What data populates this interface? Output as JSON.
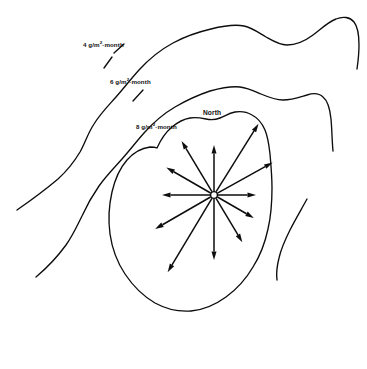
{
  "figure": {
    "type": "contour-map",
    "background_color": "#ffffff",
    "line_color": "#0d0d0d",
    "width": 367,
    "height": 369
  },
  "labels": {
    "contour_4": {
      "value": "4",
      "unit_prefix": " g/m",
      "exponent": "2",
      "unit_suffix": "·month"
    },
    "contour_6": {
      "value": "6",
      "unit_prefix": " g/m",
      "exponent": "2",
      "unit_suffix": "·month"
    },
    "contour_8": {
      "value": "8",
      "unit_prefix": " g/m",
      "exponent": "2",
      "unit_suffix": "·month"
    },
    "north": "North"
  },
  "contours": [
    {
      "name": "contour-4",
      "label": "4 g/m2·month",
      "level": 4,
      "closed": false,
      "path": "M 17 210 C 30 201 45 190 58 179 C 68 170 74 162 80 152 C 85 143 88 133 94 124 C 100 114 108 106 116 97 C 124 88 130 80 139 70 C 149 59 160 50 173 43 C 186 36 198 32 211 29 C 223 26 234 24 244 26 C 253 28 259 33 266 37 C 273 41 279 45 287 45 C 296 45 305 41 313 35 C 321 29 328 22 336 19 C 343 16 350 17 354 22 C 358 27 359 35 359 45 C 359 54 358 62 357 69"
    },
    {
      "name": "contour-6",
      "label": "6 g/m2·month",
      "level": 6,
      "closed": false,
      "path": "M 36 277 C 48 267 58 256 66 245 C 73 235 77 226 82 216 C 87 205 92 196 99 186 C 106 176 114 168 122 159 C 130 150 136 142 144 133 C 153 123 163 114 175 107 C 187 100 198 95 210 91 C 221 88 231 86 240 87 C 248 88 254 91 261 94 C 268 97 275 100 283 100 C 292 100 300 97 307 95 C 313 93 319 93 323 97 C 328 101 330 109 331 119 C 332 130 332 141 333 151"
    },
    {
      "name": "contour-8",
      "label": "8 g/m2·month",
      "level": 8,
      "closed": true,
      "path": "M 157 148 C 161 139 166 132 172 127 C 178 122 184 119 190 118 C 196 117 201 118 206 119 C 211 120 215 120 220 118 C 225 116 229 113 235 112 C 241 111 247 112 252 115 C 258 118 262 123 265 130 C 268 137 269 145 270 154 C 271 165 272 176 272 188 C 272 202 271 216 268 229 C 265 243 260 256 253 267 C 246 279 237 289 226 297 C 215 305 203 310 191 311 C 178 312 166 309 155 303 C 143 296 133 286 125 274 C 117 262 112 248 110 234 C 108 219 109 205 112 192 C 115 179 120 168 127 160 C 134 152 142 148 150 147 C 153 147 155 147 157 148 Z"
    },
    {
      "name": "right-edge-line",
      "label": "",
      "level": null,
      "closed": false,
      "path": "M 307 199 C 301 210 295 220 290 230 C 285 240 281 249 279 258 C 277 266 276 273 277 280"
    }
  ],
  "source_point": {
    "name": "source-hub",
    "cx": 214,
    "cy": 195,
    "radius": 3.4
  },
  "rays": [
    {
      "name": "ray-n",
      "bearing_deg": 0,
      "angle_deg": -90,
      "length": 50,
      "label": "north"
    },
    {
      "name": "ray-nne",
      "bearing_deg": 30,
      "angle_deg": -58,
      "length": 84,
      "label": "north-northeast"
    },
    {
      "name": "ray-ene",
      "bearing_deg": 60,
      "angle_deg": -29,
      "length": 67,
      "label": "east-northeast"
    },
    {
      "name": "ray-e",
      "bearing_deg": 90,
      "angle_deg": 0,
      "length": 42,
      "label": "east"
    },
    {
      "name": "ray-ese",
      "bearing_deg": 120,
      "angle_deg": 30,
      "length": 46,
      "label": "east-southeast"
    },
    {
      "name": "ray-sse",
      "bearing_deg": 150,
      "angle_deg": 59,
      "length": 55,
      "label": "south-southeast"
    },
    {
      "name": "ray-s",
      "bearing_deg": 180,
      "angle_deg": 90,
      "length": 65,
      "label": "south"
    },
    {
      "name": "ray-ssw",
      "bearing_deg": 210,
      "angle_deg": 121,
      "length": 90,
      "label": "south-southwest"
    },
    {
      "name": "ray-wsw",
      "bearing_deg": 240,
      "angle_deg": 150,
      "length": 68,
      "label": "west-southwest"
    },
    {
      "name": "ray-w",
      "bearing_deg": 270,
      "angle_deg": 180,
      "length": 52,
      "label": "west"
    },
    {
      "name": "ray-wnw",
      "bearing_deg": 300,
      "angle_deg": -150,
      "length": 55,
      "label": "west-northwest"
    },
    {
      "name": "ray-nnw",
      "bearing_deg": 330,
      "angle_deg": -121,
      "length": 63,
      "label": "north-northwest"
    }
  ],
  "label_leaders": [
    {
      "name": "leader-4",
      "path": "M 114 53 L 124 44"
    },
    {
      "name": "leader-6",
      "path": "M 112 57 L 104 68"
    },
    {
      "name": "leader-8",
      "path": "M 143 90 L 133 101"
    }
  ]
}
